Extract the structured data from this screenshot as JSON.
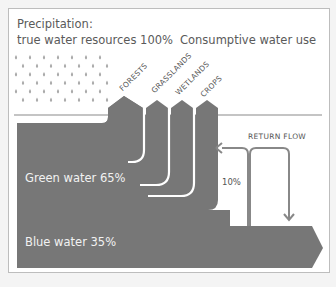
{
  "diagram": {
    "title_line1": "Precipitation:",
    "title_line2": "true water resources 100%",
    "consumptive_label": "Consumptive water use",
    "categories": [
      "FORESTS",
      "GRASSLANDS",
      "WETLANDS",
      "CROPS"
    ],
    "return_flow_label": "RETURN FLOW",
    "return_flow_pct": "10%",
    "green_water_label": "Green water 65%",
    "blue_water_label": "Blue water 35%",
    "colors": {
      "flow": "#777777",
      "rain": "#a8a8a8",
      "line": "#8a8a8a",
      "background": "#ffffff"
    }
  }
}
